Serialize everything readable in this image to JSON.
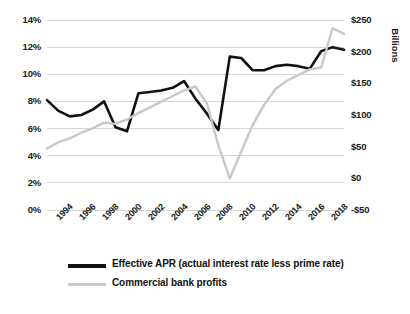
{
  "chart_data": {
    "type": "line",
    "title": "",
    "xlabel": "",
    "ylabel": "",
    "y_left": {
      "label": "",
      "ticks": [
        "0%",
        "2%",
        "4%",
        "6%",
        "8%",
        "10%",
        "12%",
        "14%"
      ],
      "tick_values": [
        0,
        2,
        4,
        6,
        8,
        10,
        12,
        14
      ],
      "ylim": [
        0,
        14
      ],
      "unit": "percent"
    },
    "y_right": {
      "label": "Billions",
      "ticks": [
        "-$50",
        "$0",
        "$50",
        "$100",
        "$150",
        "$200",
        "$250"
      ],
      "tick_values": [
        -50,
        0,
        50,
        100,
        150,
        200,
        250
      ],
      "ylim": [
        -50,
        250
      ],
      "unit": "billions_usd"
    },
    "grid": true,
    "legend_position": "bottom",
    "x_tick_labels": [
      "1994",
      "1996",
      "1998",
      "2000",
      "2002",
      "2004",
      "2006",
      "2008",
      "2010",
      "2012",
      "2014",
      "2016",
      "2018"
    ],
    "x": [
      1993,
      1994,
      1995,
      1996,
      1997,
      1998,
      1999,
      2000,
      2001,
      2002,
      2003,
      2004,
      2005,
      2006,
      2007,
      2008,
      2009,
      2010,
      2011,
      2012,
      2013,
      2014,
      2015,
      2016,
      2017,
      2018,
      2019
    ],
    "series": [
      {
        "name": "Effective APR (actual interest rate less prime rate)",
        "axis": "left",
        "color": "#111111",
        "unit": "percent",
        "values": [
          8.1,
          7.3,
          6.9,
          7.0,
          7.4,
          8.0,
          6.1,
          5.8,
          8.6,
          8.7,
          8.8,
          9.0,
          9.5,
          8.2,
          7.1,
          5.9,
          11.3,
          11.2,
          10.3,
          10.3,
          10.6,
          10.7,
          10.6,
          10.4,
          11.7,
          12.0,
          11.8
        ]
      },
      {
        "name": "Commercial bank profits",
        "axis": "right",
        "color": "#c8c8c8",
        "unit": "billions_usd",
        "values": [
          47,
          57,
          63,
          72,
          79,
          88,
          86,
          93,
          103,
          112,
          121,
          130,
          139,
          145,
          118,
          52,
          0,
          42,
          84,
          116,
          141,
          154,
          163,
          172,
          175,
          237,
          228
        ]
      }
    ],
    "annotations": []
  },
  "legend": {
    "items": [
      {
        "label": "Effective APR (actual interest rate less prime rate)",
        "color": "#111111",
        "weight": "thick"
      },
      {
        "label": "Commercial bank profits",
        "color": "#c8c8c8",
        "weight": "thin"
      }
    ]
  }
}
